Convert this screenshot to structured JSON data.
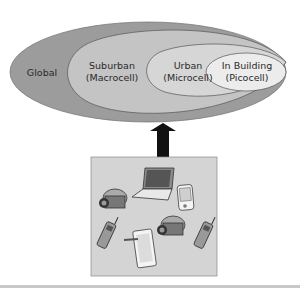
{
  "diagram": {
    "zones": [
      {
        "name": "Global",
        "line1": "Global",
        "line2": ""
      },
      {
        "name": "Suburban",
        "line1": "Suburban",
        "line2": "(Macrocell)"
      },
      {
        "name": "Urban",
        "line1": "Urban",
        "line2": "(Microcell)"
      },
      {
        "name": "In Building",
        "line1": "In Building",
        "line2": "(Picocell)"
      }
    ],
    "connector": "bidirectional-arrow",
    "devices": [
      "laptop",
      "pda",
      "video-camera",
      "video-camera",
      "mobile-phone",
      "mobile-phone",
      "tablet-with-stylus"
    ],
    "colors": {
      "global": "#9c9c9c",
      "suburban": "#c4c4c4",
      "urban": "#d6d6d6",
      "in_building": "#ececec",
      "device_box": "#d4d4d4",
      "arrow": "#111111",
      "rule": "#c8c8c8"
    }
  }
}
